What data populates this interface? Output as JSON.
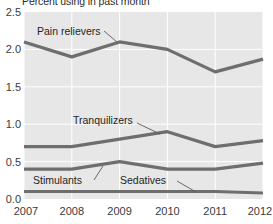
{
  "chart_data": {
    "type": "line",
    "title": "Percent using in past month",
    "title_clipped": true,
    "xlabel": "",
    "ylabel": "",
    "categories": [
      "2007",
      "2008",
      "2009",
      "2010",
      "2011",
      "2012"
    ],
    "x": [
      2007,
      2008,
      2009,
      2010,
      2011,
      2012
    ],
    "ylim": [
      0.0,
      2.5
    ],
    "xlim": [
      2007,
      2012
    ],
    "y_ticks": [
      "0.0",
      "0.5",
      "1.0",
      "1.5",
      "2.0",
      "2.5"
    ],
    "y_tick_values": [
      0.0,
      0.5,
      1.0,
      1.5,
      2.0,
      2.5
    ],
    "x_ticks": [
      "2007",
      "2008",
      "2009",
      "2010",
      "2011",
      "2012"
    ],
    "grid": "horizontal-and-vertical-white-on-gray",
    "legend": "inline-labels-with-leader-lines",
    "plot_background": "#e7e7e7",
    "line_color": "#6e6e6e",
    "series": [
      {
        "name": "Pain relievers",
        "label": "Pain relievers",
        "values": [
          2.1,
          1.9,
          2.1,
          2.0,
          1.7,
          1.87
        ]
      },
      {
        "name": "Tranquilizers",
        "label": "Tranquilizers",
        "values": [
          0.7,
          0.7,
          0.8,
          0.9,
          0.7,
          0.78
        ]
      },
      {
        "name": "Stimulants",
        "label": "Stimulants",
        "values": [
          0.4,
          0.4,
          0.5,
          0.4,
          0.4,
          0.48
        ]
      },
      {
        "name": "Sedatives",
        "label": "Sedatives",
        "values": [
          0.1,
          0.1,
          0.1,
          0.1,
          0.1,
          0.08
        ]
      }
    ],
    "annotations": [
      {
        "text": "Pain relievers",
        "x": 33,
        "y": 34
      },
      {
        "text": "Tranquilizers",
        "x": 100,
        "y": 120
      },
      {
        "text": "Stimulants",
        "x": 33,
        "y": 183
      },
      {
        "text": "Sedatives",
        "x": 123,
        "y": 183
      }
    ]
  }
}
